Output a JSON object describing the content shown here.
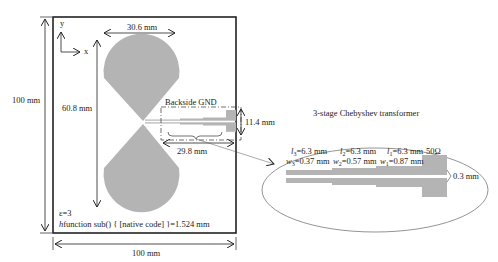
{
  "colors": {
    "metal": "#b4b4b4",
    "line": "#222222",
    "background": "#ffffff"
  },
  "board": {
    "width_label": "100 mm",
    "height_label": "100 mm",
    "permittivity_label": "ε=3",
    "thickness_label": "h=1.524 mm"
  },
  "axes": {
    "x_label": "x",
    "y_label": "y"
  },
  "antenna": {
    "width_label": "30.6 mm",
    "length_label": "60.8 mm"
  },
  "ground": {
    "label": "Backside GND",
    "height_label": "11.4 mm",
    "length_label": "29.8 mm"
  },
  "inset": {
    "title": "3-stage Chebyshev transformer",
    "sections": [
      {
        "l_sym": "l",
        "l_sub": "3",
        "l_val": "=6.3 mm",
        "w_sym": "w",
        "w_sub": "3",
        "w_val": "=0.37 mm"
      },
      {
        "l_sym": "l",
        "l_sub": "2",
        "l_val": "=6.3 mm",
        "w_sym": "w",
        "w_sub": "2",
        "w_val": "=0.57 mm"
      },
      {
        "l_sym": "l",
        "l_sub": "1",
        "l_val": "=6.3 mm",
        "w_sym": "w",
        "w_sub": "1",
        "w_val": "=0.87 mm"
      }
    ],
    "port_label": "50Ω",
    "gap_label": "0.3 mm"
  }
}
